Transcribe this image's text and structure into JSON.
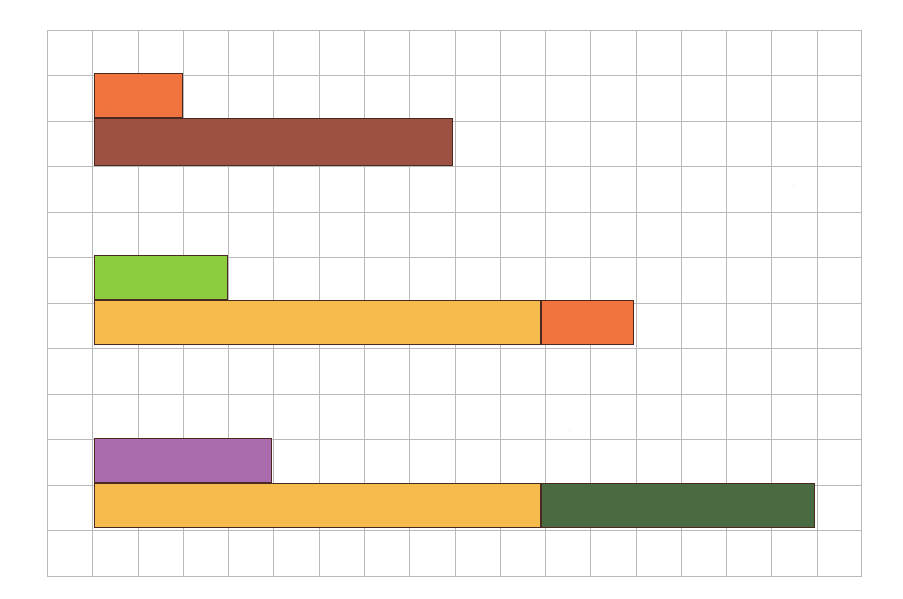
{
  "figure": {
    "kind": "hand-drawn-bar-chart-on-graph-paper",
    "background_color": "#ffffff",
    "grid": {
      "line_color": "#b9b9b9",
      "columns": 18,
      "rows": 12,
      "cell_width_px": 45.28,
      "cell_height_px": 45.5,
      "origin_x_px": 47,
      "origin_y_px": 30,
      "width_px": 815,
      "height_px": 546,
      "visible": true
    },
    "outline_color": "#4a2a20"
  },
  "chart_data": {
    "type": "bar",
    "orientation": "horizontal",
    "title": "",
    "subtitle": "",
    "xlabel": "",
    "ylabel": "",
    "grid": true,
    "legend": "none",
    "axis_tick_labels": [],
    "xlim": [
      0,
      18
    ],
    "ylim": [
      0,
      12
    ],
    "note": "Three groups; each group has an upper single bar and a lower bar that is stacked (two segments). Lengths are read in grid cells from the left grid edge.",
    "categories": [
      "Group 1",
      "Group 2",
      "Group 3"
    ],
    "bars": [
      {
        "group": "Group 1",
        "row": "upper",
        "label": "orange-bar",
        "color": "#f1743e",
        "start_cells": 1,
        "length_cells": 2,
        "end_cells": 3,
        "top_row": 1,
        "height_rows": 1,
        "px": {
          "x": 94,
          "y": 73,
          "w": 89,
          "h": 45
        }
      },
      {
        "group": "Group 1",
        "row": "lower",
        "label": "brown-bar",
        "color": "#9c5142",
        "start_cells": 1,
        "length_cells": 8,
        "end_cells": 9,
        "top_row": 2,
        "height_rows": 1,
        "px": {
          "x": 94,
          "y": 118,
          "w": 359,
          "h": 48
        }
      },
      {
        "group": "Group 2",
        "row": "upper",
        "label": "light-green-bar",
        "color": "#8dcb3f",
        "start_cells": 1,
        "length_cells": 3,
        "end_cells": 4,
        "top_row": 5,
        "height_rows": 1,
        "px": {
          "x": 94,
          "y": 255,
          "w": 134,
          "h": 45
        }
      },
      {
        "group": "Group 2",
        "row": "lower",
        "label": "amber-bar-segment",
        "color": "#f6bb4d",
        "start_cells": 1,
        "length_cells": 10,
        "end_cells": 11,
        "top_row": 6,
        "height_rows": 1,
        "px": {
          "x": 94,
          "y": 300,
          "w": 447,
          "h": 45
        }
      },
      {
        "group": "Group 2",
        "row": "lower",
        "label": "orange-bar-segment",
        "color": "#f1743e",
        "start_cells": 11,
        "length_cells": 2,
        "end_cells": 13,
        "top_row": 6,
        "height_rows": 1,
        "px": {
          "x": 541,
          "y": 300,
          "w": 93,
          "h": 45
        }
      },
      {
        "group": "Group 3",
        "row": "upper",
        "label": "purple-bar",
        "color": "#ab6cae",
        "start_cells": 1,
        "length_cells": 4,
        "end_cells": 5,
        "top_row": 9,
        "height_rows": 1,
        "px": {
          "x": 94,
          "y": 438,
          "w": 178,
          "h": 45
        }
      },
      {
        "group": "Group 3",
        "row": "lower",
        "label": "amber-bar-segment",
        "color": "#f6bb4d",
        "start_cells": 1,
        "length_cells": 10,
        "end_cells": 11,
        "top_row": 10,
        "height_rows": 1,
        "px": {
          "x": 94,
          "y": 483,
          "w": 447,
          "h": 45
        }
      },
      {
        "group": "Group 3",
        "row": "lower",
        "label": "dark-green-bar-segment",
        "color": "#4a6b42",
        "start_cells": 11,
        "length_cells": 6,
        "end_cells": 17,
        "top_row": 10,
        "height_rows": 1,
        "px": {
          "x": 541,
          "y": 483,
          "w": 274,
          "h": 45
        }
      }
    ],
    "series": [
      {
        "name": "upper",
        "categories": [
          "Group 1",
          "Group 2",
          "Group 3"
        ],
        "values": [
          2,
          3,
          4
        ]
      },
      {
        "name": "lower-first-segment",
        "categories": [
          "Group 1",
          "Group 2",
          "Group 3"
        ],
        "values": [
          8,
          10,
          10
        ]
      },
      {
        "name": "lower-second-segment",
        "categories": [
          "Group 1",
          "Group 2",
          "Group 3"
        ],
        "values": [
          0,
          2,
          6
        ]
      }
    ],
    "colors": {
      "orange": "#f1743e",
      "brown": "#9c5142",
      "light_green": "#8dcb3f",
      "amber": "#f6bb4d",
      "purple": "#ab6cae",
      "dark_green": "#4a6b42",
      "outline": "#4a2a20",
      "grid_line": "#b9b9b9",
      "paper": "#ffffff"
    }
  }
}
